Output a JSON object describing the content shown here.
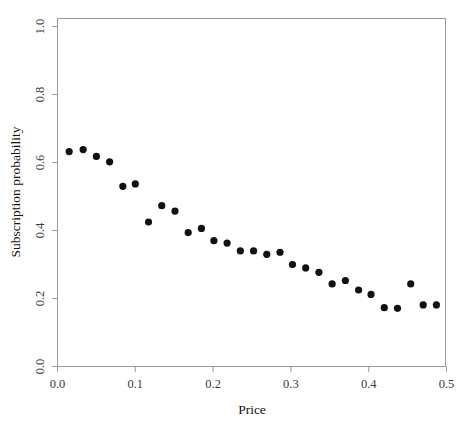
{
  "figure": {
    "top_caption": "",
    "bottom_caption": ""
  },
  "chart_data": {
    "type": "scatter",
    "title": "",
    "xlabel": "Price",
    "ylabel": "Subscription probability",
    "xlim": [
      0.0,
      0.5
    ],
    "ylim": [
      0.0,
      1.0
    ],
    "xticks": [
      "0.0",
      "0.1",
      "0.2",
      "0.3",
      "0.4",
      "0.5"
    ],
    "xtick_values": [
      0.0,
      0.1,
      0.2,
      0.3,
      0.4,
      0.5
    ],
    "yticks": [
      "0.0",
      "0.2",
      "0.4",
      "0.6",
      "0.8",
      "1.0"
    ],
    "ytick_values": [
      0.0,
      0.2,
      0.4,
      0.6,
      0.8,
      1.0
    ],
    "grid": false,
    "legend": "none",
    "marker": "filled-circle",
    "marker_color": "#111111",
    "series": [
      {
        "name": "Subscription probability vs price",
        "x": [
          0.015,
          0.033,
          0.05,
          0.067,
          0.084,
          0.1,
          0.117,
          0.134,
          0.151,
          0.168,
          0.185,
          0.201,
          0.218,
          0.235,
          0.252,
          0.269,
          0.286,
          0.302,
          0.319,
          0.336,
          0.353,
          0.37,
          0.387,
          0.403,
          0.42,
          0.437,
          0.454,
          0.47,
          0.487
        ],
        "y": [
          0.632,
          0.638,
          0.618,
          0.602,
          0.53,
          0.537,
          0.425,
          0.473,
          0.457,
          0.394,
          0.406,
          0.37,
          0.363,
          0.34,
          0.34,
          0.33,
          0.336,
          0.3,
          0.29,
          0.277,
          0.243,
          0.253,
          0.225,
          0.212,
          0.173,
          0.171,
          0.243,
          0.181,
          0.181
        ]
      }
    ]
  }
}
